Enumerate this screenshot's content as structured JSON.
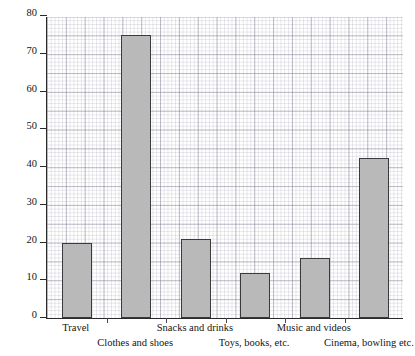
{
  "chart_data": {
    "type": "bar",
    "title": "",
    "xlabel": "",
    "ylabel": "Amount spent (£)",
    "categories": [
      "Travel",
      "Clothes and shoes",
      "Snacks and drinks",
      "Toys, books, etc.",
      "Music and videos",
      "Cinema, bowling etc."
    ],
    "values": [
      20,
      75,
      21,
      12,
      16,
      42.5
    ],
    "ylim": [
      0,
      80
    ],
    "yticks": [
      0,
      10,
      20,
      30,
      40,
      50,
      60,
      70,
      80
    ],
    "ytick_labels": [
      "0",
      "10",
      "20",
      "30",
      "40",
      "50",
      "60",
      "70",
      "80"
    ],
    "grid": true,
    "grid_minor": true,
    "legend": false,
    "bar_fill_color": "#b9b9b9",
    "bar_edge_color": "#3a3a3a",
    "axis_color": "#2a2a2a",
    "grid_color": "#9a9aae",
    "background_color": "#ffffff"
  },
  "labels": {
    "row_assignment": [
      0,
      1,
      0,
      1,
      0,
      1
    ]
  }
}
